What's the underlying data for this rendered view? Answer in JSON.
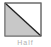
{
  "tile": {
    "label": "Half",
    "icon": "diagonal-half-fill-icon",
    "colors": {
      "border": "#555555",
      "fill": "#c8c8c8",
      "background": "#ffffff",
      "label": "#b0b0b0"
    }
  }
}
